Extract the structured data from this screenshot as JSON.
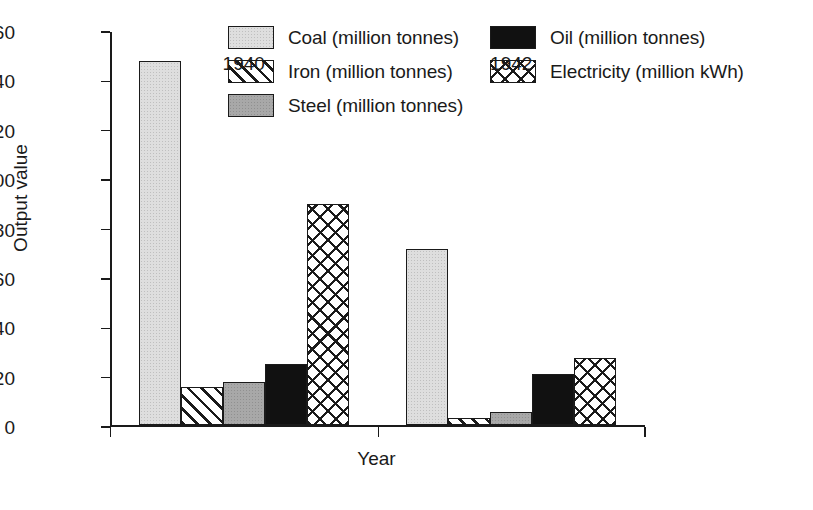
{
  "chart_data": {
    "type": "bar",
    "title": "",
    "subtitle": "",
    "xlabel": "Year",
    "ylabel": "Output value",
    "categories": [
      "1940",
      "1942"
    ],
    "ylim": [
      0,
      160
    ],
    "yticks": [
      0,
      20,
      40,
      60,
      80,
      100,
      120,
      140,
      160
    ],
    "ytick_labels": [
      "0",
      "20",
      "40",
      "60",
      "80",
      "100",
      "120",
      "140",
      "160"
    ],
    "grid": false,
    "legend_position": "top-right",
    "series": [
      {
        "name": "Coal (million tonnes)",
        "short": "Coal",
        "pattern": "light-gray-stipple",
        "color": "#dedede",
        "values": [
          147.5,
          71.5
        ]
      },
      {
        "name": "Iron (million tonnes)",
        "short": "Iron",
        "pattern": "diagonal-hatch",
        "color": "#ffffff",
        "values": [
          15.5,
          3.0
        ]
      },
      {
        "name": "Steel (million tonnes)",
        "short": "Steel",
        "pattern": "medium-gray-stipple",
        "color": "#a8a8a8",
        "values": [
          17.5,
          5.5
        ]
      },
      {
        "name": "Oil (million tonnes)",
        "short": "Oil",
        "pattern": "solid-black",
        "color": "#111111",
        "values": [
          25.0,
          21.0
        ]
      },
      {
        "name": "Electricity (million kWh)",
        "short": "Electricity",
        "pattern": "cross-hatch",
        "color": "#ffffff",
        "values": [
          89.5,
          27.5
        ]
      }
    ]
  },
  "legend": {
    "items": [
      {
        "label": "Coal (million tonnes)",
        "fill_class": "fill-coal"
      },
      {
        "label": "Oil (million tonnes)",
        "fill_class": "fill-oil"
      },
      {
        "label": "Iron (million tonnes)",
        "fill_class": "fill-iron"
      },
      {
        "label": "Electricity (million kWh)",
        "fill_class": "fill-electricity"
      },
      {
        "label": "Steel (million tonnes)",
        "fill_class": "fill-steel"
      }
    ]
  },
  "axes": {
    "y_title": "Output value",
    "x_title": "Year"
  }
}
